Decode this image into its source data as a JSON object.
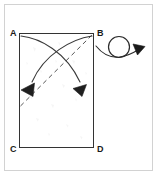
{
  "figure": {
    "colors": {
      "frame_border": "#d2d2d2",
      "paper_fill": "#ffffff",
      "paper_outline": "#333333",
      "crease_line": "#555555",
      "fold_arrow": "#2b2b2b",
      "turnover_symbol": "#1a1a1a",
      "label_text": "#1a1a1a"
    },
    "paper": {
      "name": "rectangle-sheet",
      "shape": "rectangle",
      "x": 19,
      "y": 33,
      "width": 75,
      "height": 115
    },
    "vertex_labels": [
      {
        "id": "A",
        "text": "A",
        "corner": "top-left"
      },
      {
        "id": "B",
        "text": "B",
        "corner": "top-right"
      },
      {
        "id": "C",
        "text": "C",
        "corner": "bottom-left"
      },
      {
        "id": "D",
        "text": "D",
        "corner": "bottom-right"
      }
    ],
    "crease": {
      "name": "diagonal-crease",
      "style": "dashed",
      "from": "lower-left-interior",
      "to": "B"
    },
    "fold_arrows": [
      {
        "name": "fold-arrow-a-to-right",
        "from": "A",
        "to": "lower-right-interior",
        "direction": "down-right-curving"
      },
      {
        "name": "fold-arrow-b-to-left",
        "from": "B",
        "to": "lower-left-interior",
        "direction": "down-left-curving"
      }
    ],
    "turnover_symbol": {
      "name": "turn-over-loop-arrow",
      "description": "circular loop arrow with solid arrowhead pointing right",
      "meaning": "turn the paper over"
    }
  }
}
